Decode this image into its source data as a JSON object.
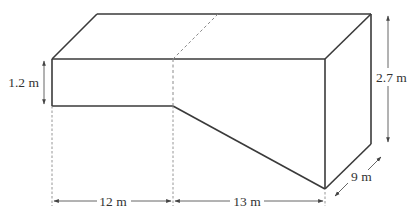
{
  "diagram": {
    "labels": {
      "shallow_depth": "1.2 m",
      "deep_depth": "2.7 m",
      "flat_length": "12 m",
      "sloped_length": "13 m",
      "width": "9 m"
    },
    "measurements": {
      "shallow_depth_m": 1.2,
      "deep_depth_m": 2.7,
      "flat_length_m": 12,
      "sloped_length_m": 13,
      "width_m": 9
    },
    "colors": {
      "edge": "#3a3a3a",
      "hidden_edge": "#8a8a8a",
      "text": "#333333",
      "background": "#ffffff"
    }
  }
}
